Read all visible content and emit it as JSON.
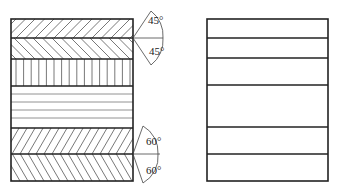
{
  "figure": {
    "left_panel": {
      "description": "layered ply stack with hatching",
      "layers": [
        {
          "name": "ply-1",
          "hatch": "diagonal-45-right"
        },
        {
          "name": "ply-2",
          "hatch": "diagonal-45-left"
        },
        {
          "name": "ply-3",
          "hatch": "vertical"
        },
        {
          "name": "ply-4",
          "hatch": "horizontal"
        },
        {
          "name": "ply-5",
          "hatch": "diagonal-60-right"
        },
        {
          "name": "ply-6",
          "hatch": "diagonal-60-left"
        }
      ],
      "angle_labels": {
        "top_upper": "45°",
        "top_lower": "45°",
        "bottom_upper": "60°",
        "bottom_lower": "60°"
      }
    },
    "right_panel": {
      "description": "layer outline without hatching",
      "layer_count": 6
    },
    "colors": {
      "line": "#222222",
      "hatch": "#555555",
      "background": "#ffffff"
    }
  }
}
